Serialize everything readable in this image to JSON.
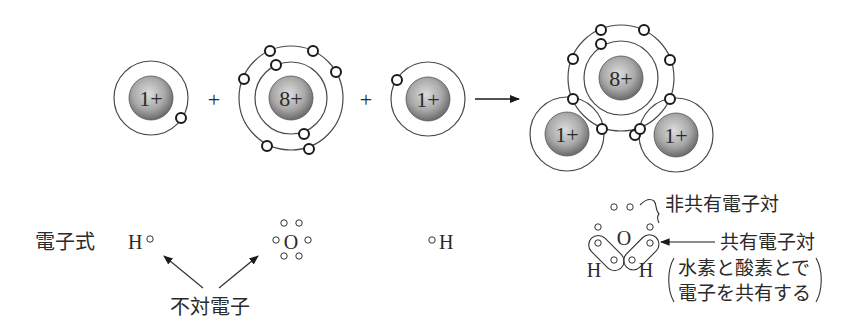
{
  "colors": {
    "line": "#4a4a4a",
    "electron_stroke": "#1a1a1a",
    "nucleus_light": "#d9d9d9",
    "nucleus_dark": "#6e6e6e",
    "text": "#2a2a2a"
  },
  "top_row": {
    "hydrogen_left": {
      "nucleus_label": "1+",
      "electrons": 1
    },
    "plus_1": "+",
    "oxygen": {
      "nucleus_label": "8+",
      "inner_shell_electrons": 2,
      "outer_shell_electrons": 6
    },
    "plus_2": "+",
    "hydrogen_right": {
      "nucleus_label": "1+",
      "electrons": 1
    },
    "reaction_arrow": "→",
    "water_molecule": {
      "oxygen_label": "8+",
      "hydrogen_left_label": "1+",
      "hydrogen_right_label": "1+"
    }
  },
  "bottom_row": {
    "row_label": "電子式",
    "h_left": {
      "symbol": "H",
      "dot": "∘"
    },
    "oxygen": {
      "symbol": "O",
      "dots": 6
    },
    "h_right": {
      "symbol": "H",
      "dot": "∘"
    },
    "unpaired_label": "不対電子",
    "water_lewis": {
      "o_symbol": "O",
      "h_left_symbol": "H",
      "h_right_symbol": "H",
      "lone_pair_label": "非共有電子対",
      "shared_pair_label": "共有電子対",
      "note_line1": "水素と酸素とで",
      "note_line2": "電子を共有する"
    }
  }
}
